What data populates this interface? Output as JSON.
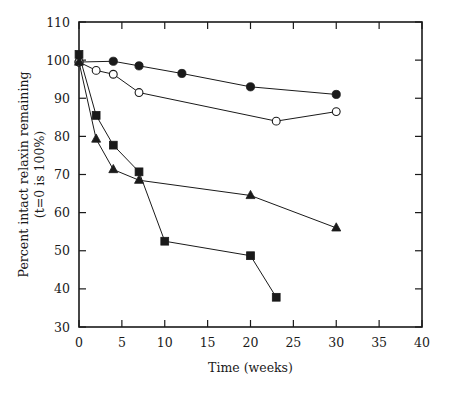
{
  "chart_data": {
    "type": "line",
    "title": "",
    "xlabel": "Time (weeks)",
    "ylabel": "Percent intact relaxin remaining (t=0 is 100%)",
    "ylabel_line1": "Percent intact relaxin remaining",
    "ylabel_line2": "(t=0 is 100%)",
    "xlim": [
      0,
      40
    ],
    "ylim": [
      30,
      110
    ],
    "xticks": [
      0,
      5,
      10,
      15,
      20,
      25,
      30,
      35,
      40
    ],
    "yticks": [
      30,
      40,
      50,
      60,
      70,
      80,
      90,
      100,
      110
    ],
    "xtick_labels": [
      "0",
      "5",
      "10",
      "15",
      "20",
      "25",
      "30",
      "35",
      "40"
    ],
    "ytick_labels": [
      "30",
      "40",
      "50",
      "60",
      "70",
      "80",
      "90",
      "100",
      "110"
    ],
    "grid": false,
    "legend": "none",
    "marker_color": "#1a1a1a",
    "line_color": "#1a1a1a",
    "series": [
      {
        "name": "filled-circle",
        "marker": "filled-circle",
        "x": [
          0,
          4,
          7,
          12,
          20,
          30
        ],
        "values": [
          99.5,
          99.7,
          98.5,
          96.5,
          93.0,
          91.0
        ]
      },
      {
        "name": "open-circle",
        "marker": "open-circle",
        "x": [
          0,
          2,
          4,
          7,
          23,
          30
        ],
        "values": [
          99.5,
          97.3,
          96.3,
          91.5,
          84.0,
          86.5
        ]
      },
      {
        "name": "filled-triangle",
        "marker": "filled-triangle",
        "x": [
          0,
          2,
          4,
          7,
          20,
          30
        ],
        "values": [
          99.5,
          79.3,
          71.3,
          68.5,
          64.5,
          56.0
        ]
      },
      {
        "name": "filled-square",
        "marker": "filled-square",
        "x": [
          0,
          2,
          4,
          7,
          10,
          20,
          23
        ],
        "values": [
          101.5,
          85.5,
          77.7,
          70.7,
          52.5,
          48.7,
          37.8
        ]
      }
    ]
  },
  "caption": {
    "text": ""
  }
}
